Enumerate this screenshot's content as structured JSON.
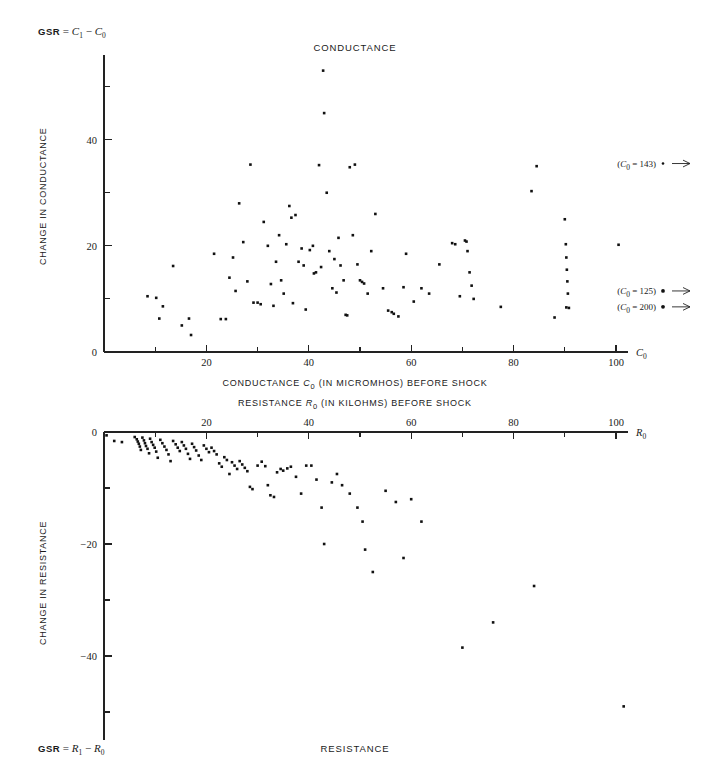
{
  "figure": {
    "background": "#ffffff",
    "point_color": "#111111",
    "axis_color": "#222222"
  },
  "panels": [
    {
      "id": "conductance",
      "title": "CONDUCTANCE",
      "corner_label": {
        "prefix": "GSR",
        "equals": "=",
        "term1": "C",
        "term1_sub": "1",
        "minus": "−",
        "term2": "C",
        "term2_sub": "0"
      },
      "ylabel": "CHANGE IN CONDUCTANCE",
      "xlabel": "CONDUCTANCE C₀ (IN MICROMHOS) BEFORE SHOCK",
      "xlabel_parts": {
        "pre": "CONDUCTANCE",
        "sym": "C",
        "sub": "0",
        "post": "(IN MICROMHOS) BEFORE SHOCK"
      },
      "x_axis_symbol": "C",
      "x_axis_symbol_sub": "0",
      "annotations": [
        {
          "text": "(C₀ = 143)",
          "value": 143,
          "sym": "C",
          "sub": "0",
          "num": "143",
          "y_data": 35.5,
          "marker": "•",
          "arrow": "→"
        },
        {
          "text": "(C₀ = 125)",
          "value": 125,
          "sym": "C",
          "sub": "0",
          "num": "125",
          "y_data": 11.5,
          "marker": "●",
          "arrow": "→"
        },
        {
          "text": "(C₀ = 200)",
          "value": 200,
          "sym": "C",
          "sub": "0",
          "num": "200",
          "y_data": 8.5,
          "marker": "●",
          "arrow": "→"
        }
      ]
    },
    {
      "id": "resistance",
      "title": "RESISTANCE",
      "corner_label": {
        "prefix": "GSR",
        "equals": "=",
        "term1": "R",
        "term1_sub": "1",
        "minus": "−",
        "term2": "R",
        "term2_sub": "0"
      },
      "ylabel": "CHANGE IN RESISTANCE",
      "xlabel": "RESISTANCE R₀ (IN KILOHMS) BEFORE SHOCK",
      "xlabel_parts": {
        "pre": "RESISTANCE",
        "sym": "R",
        "sub": "0",
        "post": "(IN KILOHMS) BEFORE SHOCK"
      },
      "x_axis_symbol": "R",
      "x_axis_symbol_sub": "0",
      "annotations": []
    }
  ],
  "chart_data": [
    {
      "type": "scatter",
      "id": "conductance",
      "title": "CONDUCTANCE",
      "xlabel": "CONDUCTANCE C0 (IN MICROMHOS) BEFORE SHOCK",
      "ylabel": "CHANGE IN CONDUCTANCE",
      "xlim": [
        0,
        108
      ],
      "ylim": [
        0,
        55
      ],
      "xticks_major": [
        20,
        40,
        60,
        80,
        100
      ],
      "xticks_minor": [
        10,
        30,
        50,
        70,
        90
      ],
      "yticks_major": [
        0,
        20,
        40
      ],
      "yticks_minor": [
        10,
        30,
        50
      ],
      "grid": false,
      "legend": "none",
      "points": [
        [
          8.5,
          10.5
        ],
        [
          10.2,
          10.2
        ],
        [
          10.8,
          6.3
        ],
        [
          11.5,
          8.6
        ],
        [
          13.5,
          16.2
        ],
        [
          15.2,
          5.0
        ],
        [
          16.6,
          6.3
        ],
        [
          17.0,
          3.2
        ],
        [
          21.5,
          18.5
        ],
        [
          22.8,
          6.2
        ],
        [
          23.8,
          6.2
        ],
        [
          24.5,
          14.0
        ],
        [
          25.2,
          17.8
        ],
        [
          25.7,
          11.5
        ],
        [
          26.4,
          28.0
        ],
        [
          27.2,
          20.7
        ],
        [
          28.0,
          13.3
        ],
        [
          28.6,
          35.3
        ],
        [
          29.2,
          9.3
        ],
        [
          30.0,
          9.3
        ],
        [
          30.6,
          9.0
        ],
        [
          31.2,
          24.5
        ],
        [
          32.0,
          20.0
        ],
        [
          32.6,
          12.8
        ],
        [
          33.1,
          8.7
        ],
        [
          33.6,
          17.0
        ],
        [
          34.2,
          22.0
        ],
        [
          34.6,
          13.5
        ],
        [
          35.1,
          11.0
        ],
        [
          35.6,
          20.3
        ],
        [
          36.2,
          27.5
        ],
        [
          36.6,
          25.3
        ],
        [
          36.9,
          9.2
        ],
        [
          37.4,
          25.8
        ],
        [
          38.0,
          17.0
        ],
        [
          38.6,
          19.5
        ],
        [
          39.0,
          16.3
        ],
        [
          39.4,
          8.0
        ],
        [
          40.2,
          19.2
        ],
        [
          40.8,
          20.0
        ],
        [
          41.0,
          14.8
        ],
        [
          41.4,
          15.0
        ],
        [
          42.0,
          35.2
        ],
        [
          42.4,
          16.0
        ],
        [
          42.8,
          53.0
        ],
        [
          43.0,
          45.0
        ],
        [
          43.5,
          30.0
        ],
        [
          44.0,
          19.0
        ],
        [
          44.6,
          12.0
        ],
        [
          45.0,
          17.5
        ],
        [
          45.4,
          11.2
        ],
        [
          45.8,
          21.5
        ],
        [
          46.2,
          16.3
        ],
        [
          46.8,
          13.5
        ],
        [
          47.2,
          7.0
        ],
        [
          47.5,
          6.9
        ],
        [
          48.0,
          34.8
        ],
        [
          48.6,
          22.0
        ],
        [
          49.0,
          35.3
        ],
        [
          49.5,
          16.5
        ],
        [
          50.0,
          13.5
        ],
        [
          50.4,
          13.2
        ],
        [
          50.8,
          12.9
        ],
        [
          51.5,
          11.0
        ],
        [
          52.2,
          19.0
        ],
        [
          53.0,
          26.0
        ],
        [
          54.5,
          12.0
        ],
        [
          55.5,
          7.8
        ],
        [
          56.2,
          7.5
        ],
        [
          56.6,
          7.2
        ],
        [
          57.5,
          6.7
        ],
        [
          58.5,
          12.2
        ],
        [
          59.0,
          18.5
        ],
        [
          60.5,
          9.5
        ],
        [
          62.0,
          12.0
        ],
        [
          63.5,
          11.0
        ],
        [
          65.5,
          16.5
        ],
        [
          68.0,
          20.5
        ],
        [
          68.6,
          20.3
        ],
        [
          69.5,
          10.5
        ],
        [
          70.5,
          21.0
        ],
        [
          70.8,
          20.8
        ],
        [
          71.0,
          19.0
        ],
        [
          71.4,
          15.0
        ],
        [
          71.8,
          12.5
        ],
        [
          72.2,
          10.0
        ],
        [
          77.5,
          8.5
        ],
        [
          83.5,
          30.3
        ],
        [
          84.5,
          35.0
        ],
        [
          88.0,
          6.5
        ],
        [
          90.0,
          25.0
        ],
        [
          90.2,
          20.3
        ],
        [
          90.3,
          17.8
        ],
        [
          90.4,
          15.5
        ],
        [
          90.5,
          13.3
        ],
        [
          90.6,
          11.0
        ],
        [
          90.3,
          8.4
        ],
        [
          90.8,
          8.3
        ],
        [
          100.5,
          20.2
        ]
      ]
    },
    {
      "type": "scatter",
      "id": "resistance",
      "title": "RESISTANCE",
      "xlabel": "RESISTANCE R0 (IN KILOHMS) BEFORE SHOCK",
      "ylabel": "CHANGE IN RESISTANCE",
      "xlim": [
        0,
        108
      ],
      "ylim": [
        -55,
        0
      ],
      "xticks_major": [
        20,
        40,
        60,
        80,
        100
      ],
      "xticks_minor": [
        10,
        30,
        50,
        70,
        90
      ],
      "yticks_major": [
        0,
        -20,
        -40
      ],
      "yticks_minor": [
        -10,
        -30,
        -50
      ],
      "grid": false,
      "legend": "none",
      "points": [
        [
          0.5,
          -0.6
        ],
        [
          2.0,
          -1.6
        ],
        [
          3.5,
          -1.8
        ],
        [
          6.0,
          -0.9
        ],
        [
          6.4,
          -1.3
        ],
        [
          6.6,
          -1.7
        ],
        [
          6.8,
          -2.1
        ],
        [
          7.0,
          -2.6
        ],
        [
          7.2,
          -3.2
        ],
        [
          7.5,
          -1.0
        ],
        [
          7.8,
          -1.5
        ],
        [
          8.0,
          -2.0
        ],
        [
          8.2,
          -2.5
        ],
        [
          8.5,
          -3.0
        ],
        [
          8.8,
          -3.8
        ],
        [
          9.0,
          -1.2
        ],
        [
          9.3,
          -1.8
        ],
        [
          9.6,
          -2.3
        ],
        [
          9.9,
          -2.8
        ],
        [
          10.2,
          -3.5
        ],
        [
          10.5,
          -4.6
        ],
        [
          11.0,
          -1.4
        ],
        [
          11.4,
          -2.0
        ],
        [
          11.8,
          -2.6
        ],
        [
          12.2,
          -3.2
        ],
        [
          12.6,
          -4.0
        ],
        [
          13.0,
          -5.2
        ],
        [
          13.5,
          -1.6
        ],
        [
          14.0,
          -2.2
        ],
        [
          14.4,
          -2.8
        ],
        [
          14.8,
          -3.4
        ],
        [
          15.2,
          -1.8
        ],
        [
          15.6,
          -2.4
        ],
        [
          16.0,
          -3.0
        ],
        [
          16.4,
          -3.9
        ],
        [
          16.8,
          -4.8
        ],
        [
          17.2,
          -2.1
        ],
        [
          17.6,
          -2.7
        ],
        [
          18.0,
          -3.3
        ],
        [
          18.5,
          -4.2
        ],
        [
          19.0,
          -5.0
        ],
        [
          19.5,
          -2.4
        ],
        [
          20.0,
          -3.0
        ],
        [
          20.5,
          -3.6
        ],
        [
          21.0,
          -2.8
        ],
        [
          21.5,
          -3.4
        ],
        [
          22.0,
          -4.0
        ],
        [
          22.5,
          -5.6
        ],
        [
          23.0,
          -6.2
        ],
        [
          23.5,
          -4.5
        ],
        [
          24.0,
          -5.0
        ],
        [
          24.5,
          -7.5
        ],
        [
          25.0,
          -5.4
        ],
        [
          25.5,
          -6.0
        ],
        [
          26.0,
          -6.6
        ],
        [
          26.5,
          -5.2
        ],
        [
          27.0,
          -5.8
        ],
        [
          27.5,
          -6.4
        ],
        [
          28.0,
          -7.0
        ],
        [
          28.5,
          -9.8
        ],
        [
          29.0,
          -10.2
        ],
        [
          30.0,
          -6.0
        ],
        [
          30.8,
          -5.3
        ],
        [
          31.5,
          -6.1
        ],
        [
          32.0,
          -9.5
        ],
        [
          32.5,
          -11.3
        ],
        [
          33.2,
          -11.6
        ],
        [
          33.8,
          -7.2
        ],
        [
          34.5,
          -6.6
        ],
        [
          35.0,
          -6.9
        ],
        [
          35.8,
          -6.5
        ],
        [
          36.5,
          -6.2
        ],
        [
          37.5,
          -8.0
        ],
        [
          38.5,
          -11.0
        ],
        [
          39.5,
          -6.0
        ],
        [
          40.5,
          -6.0
        ],
        [
          41.5,
          -8.5
        ],
        [
          42.5,
          -13.5
        ],
        [
          43.0,
          -20.0
        ],
        [
          44.5,
          -9.0
        ],
        [
          45.5,
          -7.5
        ],
        [
          46.5,
          -9.5
        ],
        [
          48.0,
          -11.0
        ],
        [
          49.5,
          -13.5
        ],
        [
          50.5,
          -16.0
        ],
        [
          51.0,
          -21.0
        ],
        [
          52.5,
          -25.0
        ],
        [
          55.0,
          -10.5
        ],
        [
          57.0,
          -12.5
        ],
        [
          58.5,
          -22.5
        ],
        [
          60.0,
          -12.0
        ],
        [
          62.0,
          -16.0
        ],
        [
          70.0,
          -38.5
        ],
        [
          76.0,
          -34.0
        ],
        [
          84.0,
          -27.5
        ],
        [
          101.5,
          -49.0
        ]
      ]
    }
  ]
}
